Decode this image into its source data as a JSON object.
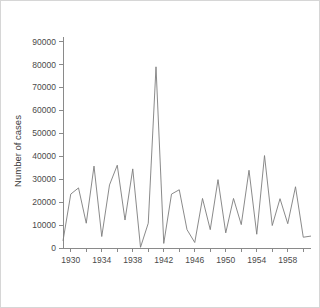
{
  "figure": {
    "background_color": "#ffffff",
    "border_color": "#d6d6d6",
    "axis_color": "#8a8a8a",
    "line_color": "#7d7d7d"
  },
  "chart_data": {
    "type": "line",
    "title": "",
    "xlabel": "",
    "ylabel": "Number of cases",
    "xlim": [
      1929,
      1961
    ],
    "ylim": [
      0,
      92000
    ],
    "grid": false,
    "legend": "none",
    "y_ticks": [
      0,
      10000,
      20000,
      30000,
      40000,
      50000,
      60000,
      70000,
      80000,
      90000
    ],
    "y_tick_labels": [
      "0",
      "10000",
      "20000",
      "30000",
      "40000",
      "50000",
      "60000",
      "70000",
      "80000",
      "90000"
    ],
    "x_ticks_major": [
      1930,
      1934,
      1938,
      1942,
      1946,
      1950,
      1954,
      1958
    ],
    "x_tick_labels": [
      "1930",
      "1934",
      "1938",
      "1942",
      "1946",
      "1950",
      "1954",
      "1958"
    ],
    "x_ticks_minor": [
      1930,
      1932,
      1934,
      1936,
      1938,
      1940,
      1942,
      1944,
      1946,
      1948,
      1950,
      1952,
      1954,
      1956,
      1958,
      1960
    ],
    "series": [
      {
        "name": "cases",
        "x": [
          1929,
          1930,
          1931,
          1932,
          1933,
          1934,
          1935,
          1936,
          1937,
          1938,
          1939,
          1940,
          1941,
          1942,
          1943,
          1944,
          1945,
          1946,
          1947,
          1948,
          1949,
          1950,
          1951,
          1952,
          1953,
          1954,
          1955,
          1956,
          1957,
          1958,
          1959,
          1960,
          1961
        ],
        "values": [
          3100,
          23500,
          26200,
          10800,
          35700,
          5000,
          27500,
          36100,
          12200,
          34500,
          300,
          10800,
          79000,
          2000,
          23500,
          25400,
          8000,
          2400,
          21600,
          8000,
          29800,
          6600,
          21600,
          10200,
          33900,
          6000,
          40300,
          9800,
          21500,
          10600,
          26700,
          4700,
          5200
        ]
      }
    ]
  }
}
